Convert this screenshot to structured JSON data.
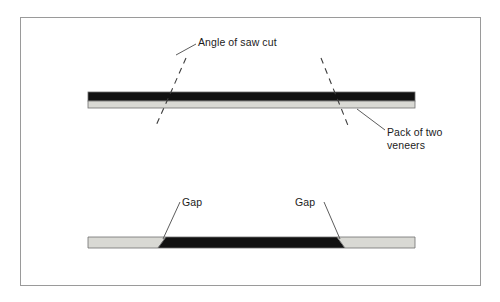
{
  "figure": {
    "width": 500,
    "height": 302,
    "background": "#ffffff",
    "border_color": "#9a9a9a"
  },
  "colors": {
    "veneer_dark": "#111111",
    "veneer_light": "#d9d9d4",
    "outline": "#6f6f6f",
    "leader_line": "#4a4a4a",
    "dash_line": "#3d3d3d",
    "text": "#1b1b1b"
  },
  "labels": {
    "angle_of_saw_cut": "Angle of saw cut",
    "pack_of_two_veneers_line1": "Pack of two",
    "pack_of_two_veneers_line2": "veneers",
    "gap_left": "Gap",
    "gap_right": "Gap"
  },
  "upper_diagram": {
    "caption": "Pack of two veneers with angled saw cut lines passing through",
    "bar": {
      "x": 88,
      "y": 92,
      "width": 327,
      "height": 16,
      "dark_layer_height": 9,
      "light_layer_height": 7
    },
    "saw_cut_lines": [
      {
        "name": "left-saw-cut",
        "x1": 186,
        "y1": 58,
        "x2": 155,
        "y2": 128
      },
      {
        "name": "right-saw-cut",
        "x1": 321,
        "y1": 58,
        "x2": 349,
        "y2": 128
      }
    ],
    "leaders": [
      {
        "name": "angle-leader",
        "x1": 196,
        "y1": 44,
        "x2": 178,
        "y2": 54
      },
      {
        "name": "pack-leader",
        "x1": 384,
        "y1": 131,
        "x2": 357,
        "y2": 110
      }
    ]
  },
  "lower_diagram": {
    "caption": "Sawn veneer pack showing gaps at each angled cut",
    "bar": {
      "x": 88,
      "y": 237,
      "width": 327,
      "height": 11
    },
    "segments": [
      {
        "name": "left-light-segment",
        "start": 88,
        "end": 162,
        "fill": "light"
      },
      {
        "name": "center-dark-segment",
        "start": 162,
        "end": 340,
        "fill": "dark"
      },
      {
        "name": "right-light-segment",
        "start": 340,
        "end": 415,
        "fill": "light"
      }
    ],
    "leaders": [
      {
        "name": "gap-left-leader",
        "x1": 180,
        "y1": 203,
        "x2": 163,
        "y2": 240
      },
      {
        "name": "gap-right-leader",
        "x1": 324,
        "y1": 203,
        "x2": 339,
        "y2": 240
      }
    ]
  }
}
